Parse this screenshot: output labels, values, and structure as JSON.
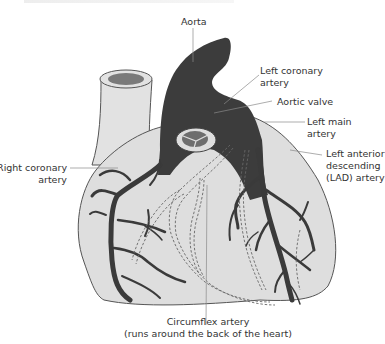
{
  "figure": {
    "title": "",
    "colors": {
      "heart_fill": "#dedede",
      "heart_outline": "#555555",
      "artery": "#3a3a3a",
      "dashed_artery": "#666666",
      "leader_line": "#8a8a8a",
      "text": "#333333"
    }
  },
  "labels": {
    "aorta": "Aorta",
    "left_coronary": [
      "Left coronary",
      "artery"
    ],
    "aortic_valve": "Aortic valve",
    "left_main": [
      "Left main",
      "artery"
    ],
    "lad": [
      "Left anterior",
      "descending",
      "(LAD) artery"
    ],
    "right_coronary": [
      "Right coronary",
      "artery"
    ],
    "circumflex": [
      "Circumflex artery",
      "(runs around the back of the heart)"
    ]
  }
}
